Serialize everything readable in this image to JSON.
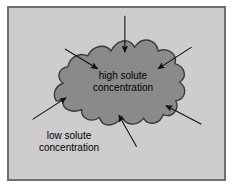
{
  "figure": {
    "background_color": "#ffffff",
    "frame": {
      "border_color": "#6f6f6f",
      "fill_color": "#cdcdcd"
    }
  },
  "labels": {
    "high": {
      "line1": "high solute",
      "line2": "concentration"
    },
    "low": {
      "line1": "low solute",
      "line2": "concentration"
    }
  },
  "blob": {
    "name": "high-concentration-region",
    "fill_color": "#8a8a8a",
    "stroke_color": "#3a3a3a"
  },
  "arrows": {
    "stroke_color": "#111111",
    "count": 6,
    "directions": [
      "down",
      "down-right",
      "down-left",
      "up-right",
      "up-left",
      "up"
    ]
  }
}
